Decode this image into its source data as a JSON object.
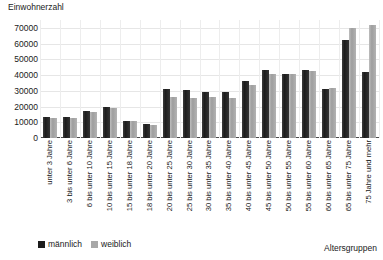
{
  "chart_data": {
    "type": "bar",
    "title": "",
    "ylabel": "Einwohnerzahl",
    "xlabel": "Altersgruppen",
    "ylim": [
      0,
      75000
    ],
    "yticks": [
      0,
      10000,
      20000,
      30000,
      40000,
      50000,
      60000,
      70000
    ],
    "ytick_labels": [
      "0",
      "10000",
      "20000",
      "30000",
      "40000",
      "50000",
      "60000",
      "70000"
    ],
    "grid": true,
    "legend_position": "bottom-left",
    "categories": [
      "unter 3 Jahre",
      "3 bis unter 6 Jahre",
      "6 bis unter 10 Jahre",
      "10 bis unter 15 Jahre",
      "15 bis unter 18 Jahre",
      "18 bis unter 20 Jahre",
      "20 bis unter 25 Jahre",
      "25 bis unter 30 Jahre",
      "30 bis unter 35 Jahre",
      "35 bis unter 40 Jahre",
      "40 bis unter 45 Jahre",
      "45 bis unter 50 Jahre",
      "50 bis unter 55 Jahre",
      "55 bis unter 60 Jahre",
      "60 bis unter 65 Jahre",
      "65 bis unter 75 Jahre",
      "75 Jahre und mehr"
    ],
    "series": [
      {
        "name": "männlich",
        "color": "#1c1c1c",
        "values": [
          13500,
          13500,
          17000,
          19500,
          11000,
          9000,
          31000,
          30500,
          29500,
          29000,
          36500,
          43000,
          41000,
          43000,
          31000,
          62000,
          42000
        ]
      },
      {
        "name": "weiblich",
        "color": "#a8a8a8",
        "values": [
          13000,
          13000,
          16500,
          19000,
          10500,
          8500,
          26000,
          25500,
          26000,
          25500,
          34000,
          41000,
          40500,
          42500,
          31500,
          70000,
          72000
        ]
      }
    ]
  }
}
